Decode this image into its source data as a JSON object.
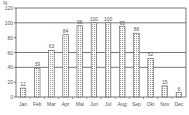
{
  "chart_data": {
    "type": "bar",
    "title": "",
    "xlabel": "",
    "ylabel": "%",
    "ylim": [
      0,
      120
    ],
    "yticks": [
      0,
      20,
      40,
      60,
      80,
      100,
      120
    ],
    "grid": true,
    "gridlines": [
      40,
      60,
      100
    ],
    "legend": null,
    "categories": [
      "Jan",
      "Feb",
      "Mar",
      "Apr",
      "Mai",
      "Jun",
      "Jul",
      "Aug",
      "Sep",
      "Okt",
      "Nov",
      "Dec"
    ],
    "values": [
      12,
      39,
      63,
      84,
      96,
      100,
      100,
      95,
      86,
      52,
      15,
      6
    ],
    "bar_style": "hatched-grid",
    "colors": {
      "bar_fill": "#d8d8d8",
      "bar_stroke": "#555555",
      "grid": "#555555",
      "axis": "#555555"
    }
  }
}
